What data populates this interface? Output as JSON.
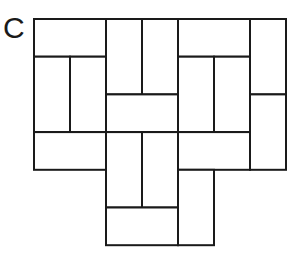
{
  "figure": {
    "panel_label": "C",
    "stroke_color": "#1a1a1a",
    "fill_color": "#ffffff",
    "grid": {
      "origin_x": 34,
      "origin_y": 19,
      "cell_w": 36,
      "cell_h": 37.7,
      "cols": 7,
      "rows": 6
    },
    "tiles": [
      {
        "id": "t1",
        "orientation": "horizontal",
        "col": 0,
        "row": 0,
        "w": 2,
        "h": 1
      },
      {
        "id": "t2",
        "orientation": "vertical",
        "col": 0,
        "row": 1,
        "w": 1,
        "h": 2
      },
      {
        "id": "t3",
        "orientation": "vertical",
        "col": 1,
        "row": 1,
        "w": 1,
        "h": 2
      },
      {
        "id": "t4",
        "orientation": "vertical",
        "col": 2,
        "row": 0,
        "w": 1,
        "h": 2
      },
      {
        "id": "t5",
        "orientation": "vertical",
        "col": 3,
        "row": 0,
        "w": 1,
        "h": 2
      },
      {
        "id": "t6",
        "orientation": "horizontal",
        "col": 2,
        "row": 2,
        "w": 2,
        "h": 1
      },
      {
        "id": "t7",
        "orientation": "horizontal",
        "col": 4,
        "row": 0,
        "w": 2,
        "h": 1
      },
      {
        "id": "t8",
        "orientation": "vertical",
        "col": 4,
        "row": 1,
        "w": 1,
        "h": 2
      },
      {
        "id": "t9",
        "orientation": "vertical",
        "col": 5,
        "row": 1,
        "w": 1,
        "h": 2
      },
      {
        "id": "t10",
        "orientation": "vertical",
        "col": 6,
        "row": 0,
        "w": 1,
        "h": 2
      },
      {
        "id": "t11",
        "orientation": "vertical",
        "col": 6,
        "row": 2,
        "w": 1,
        "h": 2
      },
      {
        "id": "t12",
        "orientation": "horizontal",
        "col": 0,
        "row": 3,
        "w": 2,
        "h": 1
      },
      {
        "id": "t13",
        "orientation": "vertical",
        "col": 2,
        "row": 3,
        "w": 1,
        "h": 2
      },
      {
        "id": "t14",
        "orientation": "vertical",
        "col": 3,
        "row": 3,
        "w": 1,
        "h": 2
      },
      {
        "id": "t15",
        "orientation": "horizontal",
        "col": 4,
        "row": 3,
        "w": 2,
        "h": 1
      },
      {
        "id": "t16",
        "orientation": "vertical",
        "col": 4,
        "row": 4,
        "w": 1,
        "h": 2
      },
      {
        "id": "t17",
        "orientation": "horizontal",
        "col": 2,
        "row": 5,
        "w": 2,
        "h": 1
      }
    ]
  }
}
